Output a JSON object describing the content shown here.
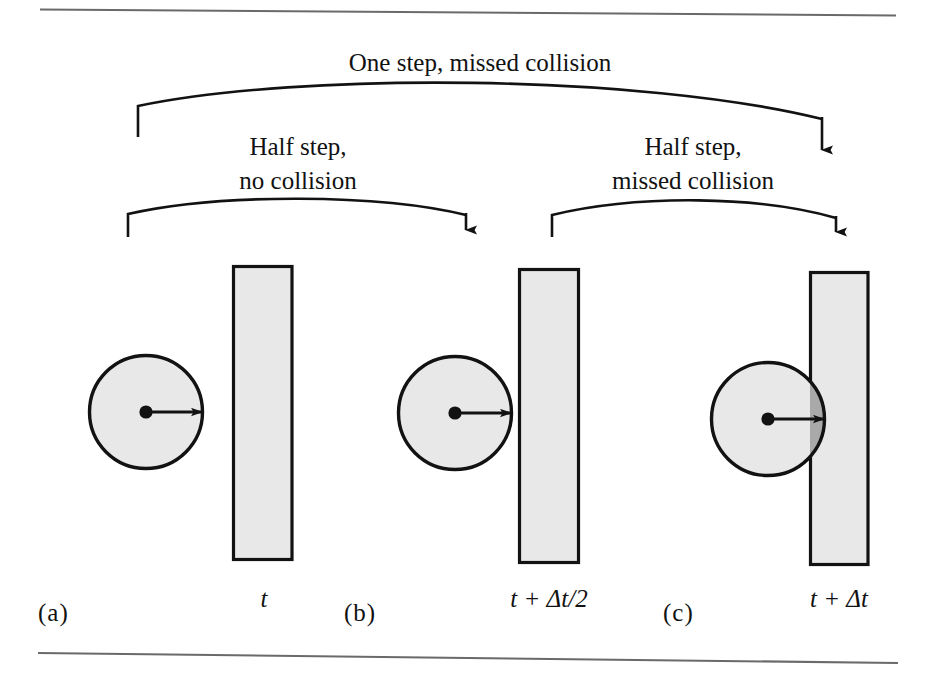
{
  "figure": {
    "title_rules": {
      "top_rule": "horizontal-rule",
      "bottom_rule": "horizontal-rule"
    },
    "annotations": {
      "one_step": {
        "line1": "One step, missed collision"
      },
      "half_step_left": {
        "line1": "Half step,",
        "line2": "no collision"
      },
      "half_step_right": {
        "line1": "Half step,",
        "line2": "missed collision"
      }
    },
    "panels": [
      {
        "letter": "(a)",
        "time_label": {
          "full": "t",
          "base": "t",
          "operator": "",
          "delta": "",
          "suffix": ""
        },
        "circle": {
          "cx": 146,
          "cy": 412,
          "r": 57,
          "fill": "#e8e8e8",
          "stroke": "#111111",
          "overlaps_wall": false
        },
        "wall": {
          "x": 233,
          "y": 266,
          "width": 59,
          "height": 294,
          "fill": "#e8e8e8",
          "stroke": "#111111"
        },
        "velocity_arrow": {
          "from_x": 146,
          "to_x": 205,
          "y": 412
        }
      },
      {
        "letter": "(b)",
        "time_label": {
          "full": "t + Δt/2",
          "base": "t",
          "operator": "+",
          "delta": "Δ",
          "suffix": "t/2"
        },
        "circle": {
          "cx": 455,
          "cy": 413,
          "r": 57,
          "fill": "#e8e8e8",
          "stroke": "#111111",
          "overlaps_wall": false
        },
        "wall": {
          "x": 519,
          "y": 269,
          "width": 60,
          "height": 294,
          "fill": "#e8e8e8",
          "stroke": "#111111"
        },
        "velocity_arrow": {
          "from_x": 455,
          "to_x": 514,
          "y": 413
        }
      },
      {
        "letter": "(c)",
        "time_label": {
          "full": "t + Δt",
          "base": "t",
          "operator": "+",
          "delta": "Δ",
          "suffix": "t"
        },
        "circle": {
          "cx": 768,
          "cy": 419,
          "r": 57,
          "fill": "#e8e8e8",
          "stroke": "#111111",
          "overlaps_wall": true
        },
        "wall": {
          "x": 810,
          "y": 272,
          "width": 58,
          "height": 293,
          "fill": "#e8e8e8",
          "stroke": "#111111"
        },
        "velocity_arrow": {
          "from_x": 768,
          "to_x": 827,
          "y": 419
        },
        "overlap_fill": "#a9a9a9"
      }
    ],
    "colors": {
      "shape_fill": "#e8e8e8",
      "overlap_fill": "#a9a9a9",
      "ink": "#111111",
      "rule": "#6a6a6a",
      "background": "#ffffff"
    }
  }
}
